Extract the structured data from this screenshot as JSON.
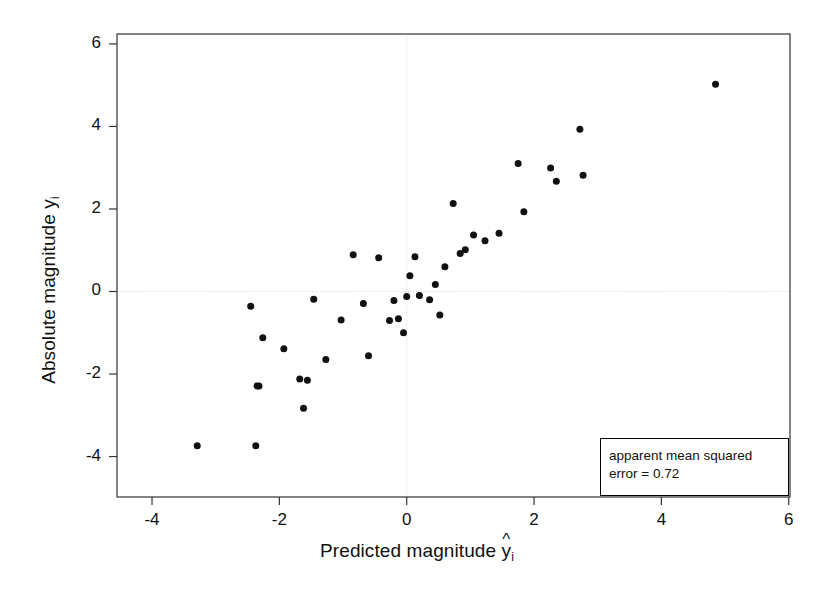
{
  "chart_data": {
    "type": "scatter",
    "title": "",
    "xlabel": "Predicted magnitude ŷi",
    "ylabel": "Absolute magnitude yi",
    "xlabel_main": "Predicted magnitude",
    "xlabel_sym": "y",
    "xlabel_sub": "i",
    "xlabel_hat": "^",
    "ylabel_main": "Absolute magnitude",
    "ylabel_sym": "y",
    "ylabel_sub": "i",
    "xlim": [
      -4.55,
      6.02
    ],
    "ylim": [
      -4.98,
      6.24
    ],
    "xticks": [
      -4,
      -2,
      0,
      2,
      4,
      6
    ],
    "xticklabels": [
      "-4",
      "-2",
      "0",
      "2",
      "4",
      "6"
    ],
    "yticks": [
      -4,
      -2,
      0,
      2,
      4,
      6
    ],
    "yticklabels": [
      "-4",
      "-2",
      "0",
      "2",
      "4",
      "6"
    ],
    "grid": "reference lines at x=0 and y=0 (light dotted)",
    "grid_color": "#d8d8d8",
    "point_color": "#111111",
    "point_size_px": 7,
    "legend": {
      "position": "bottom-right",
      "line1": "apparent mean squared",
      "line2": "error = 0.72",
      "text": "apparent mean squared error = 0.72",
      "metric_label": "apparent mean squared error",
      "metric_value": 0.72
    },
    "n_points": 40,
    "x": [
      -3.29,
      -2.37,
      -2.45,
      -2.35,
      -2.32,
      -1.93,
      -1.68,
      -1.62,
      -1.56,
      -1.46,
      -1.27,
      -1.03,
      -0.84,
      -0.68,
      -0.6,
      -0.44,
      -0.27,
      -0.2,
      -0.13,
      -0.05,
      0.0,
      0.05,
      0.13,
      0.2,
      0.36,
      0.45,
      0.52,
      0.6,
      0.73,
      0.84,
      0.92,
      1.05,
      1.23,
      1.45,
      1.75,
      1.84,
      2.26,
      2.35,
      2.77,
      4.85
    ],
    "y": [
      -3.74,
      -3.74,
      -0.36,
      -2.29,
      -1.12,
      -1.39,
      -2.12,
      -2.83,
      -2.15,
      -0.19,
      -1.65,
      -0.69,
      0.89,
      -0.29,
      -1.56,
      0.82,
      -0.7,
      -0.22,
      -0.66,
      -1.0,
      -0.12,
      0.38,
      0.84,
      -0.1,
      -0.2,
      0.17,
      -0.57,
      0.6,
      2.13,
      0.92,
      1.01,
      1.37,
      1.23,
      1.41,
      3.1,
      1.93,
      2.99,
      2.67,
      2.82,
      5.02
    ],
    "points": [
      {
        "x": -3.29,
        "y": -3.74
      },
      {
        "x": -2.45,
        "y": -0.36
      },
      {
        "x": -2.37,
        "y": -3.74
      },
      {
        "x": -2.35,
        "y": -2.29
      },
      {
        "x": -2.32,
        "y": -2.29
      },
      {
        "x": -2.26,
        "y": -1.12
      },
      {
        "x": -1.93,
        "y": -1.39
      },
      {
        "x": -1.68,
        "y": -2.12
      },
      {
        "x": -1.62,
        "y": -2.83
      },
      {
        "x": -1.56,
        "y": -2.15
      },
      {
        "x": -1.46,
        "y": -0.19
      },
      {
        "x": -1.27,
        "y": -1.65
      },
      {
        "x": -1.03,
        "y": -0.69
      },
      {
        "x": -0.84,
        "y": 0.89
      },
      {
        "x": -0.68,
        "y": -0.29
      },
      {
        "x": -0.6,
        "y": -1.56
      },
      {
        "x": -0.44,
        "y": 0.82
      },
      {
        "x": -0.27,
        "y": -0.7
      },
      {
        "x": -0.2,
        "y": -0.22
      },
      {
        "x": -0.13,
        "y": -0.66
      },
      {
        "x": -0.05,
        "y": -1.0
      },
      {
        "x": 0.0,
        "y": -0.12
      },
      {
        "x": 0.05,
        "y": 0.38
      },
      {
        "x": 0.13,
        "y": 0.84
      },
      {
        "x": 0.2,
        "y": -0.1
      },
      {
        "x": 0.36,
        "y": -0.2
      },
      {
        "x": 0.45,
        "y": 0.17
      },
      {
        "x": 0.52,
        "y": -0.57
      },
      {
        "x": 0.6,
        "y": 0.6
      },
      {
        "x": 0.73,
        "y": 2.13
      },
      {
        "x": 0.84,
        "y": 0.92
      },
      {
        "x": 0.92,
        "y": 1.01
      },
      {
        "x": 1.05,
        "y": 1.37
      },
      {
        "x": 1.23,
        "y": 1.23
      },
      {
        "x": 1.45,
        "y": 1.41
      },
      {
        "x": 1.75,
        "y": 3.1
      },
      {
        "x": 1.84,
        "y": 1.93
      },
      {
        "x": 2.26,
        "y": 2.99
      },
      {
        "x": 2.35,
        "y": 2.67
      },
      {
        "x": 2.77,
        "y": 2.82
      },
      {
        "x": 2.72,
        "y": 3.93
      },
      {
        "x": 4.85,
        "y": 5.02
      }
    ]
  }
}
